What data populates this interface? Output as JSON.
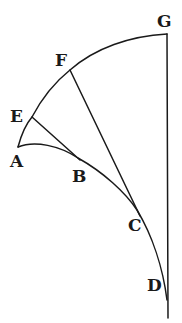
{
  "figure": {
    "type": "geometric-curve-diagram",
    "points": {
      "A": {
        "label": "A",
        "x": 18,
        "y": 147,
        "label_x": 11,
        "label_y": 166
      },
      "B": {
        "label": "B",
        "x": 78,
        "y": 158,
        "label_x": 73,
        "label_y": 182
      },
      "C": {
        "label": "C",
        "x": 137,
        "y": 210,
        "label_x": 128,
        "label_y": 230
      },
      "D": {
        "label": "D",
        "x": 167,
        "y": 300,
        "label_x": 148,
        "label_y": 289
      },
      "E": {
        "label": "E",
        "x": 32,
        "y": 117,
        "label_x": 10,
        "label_y": 122
      },
      "F": {
        "label": "F",
        "x": 70,
        "y": 70,
        "label_x": 56,
        "label_y": 66
      },
      "G": {
        "label": "G",
        "x": 167,
        "y": 34,
        "label_x": 161,
        "label_y": 27
      }
    },
    "outer_arc": "A-E-F-G",
    "inner_curve": "A-B-C-D",
    "tangent_lines": [
      "E-B",
      "F-C"
    ],
    "vertical_line": "G-D",
    "stroke_color": "#1a1a1a",
    "background": "#ffffff"
  }
}
